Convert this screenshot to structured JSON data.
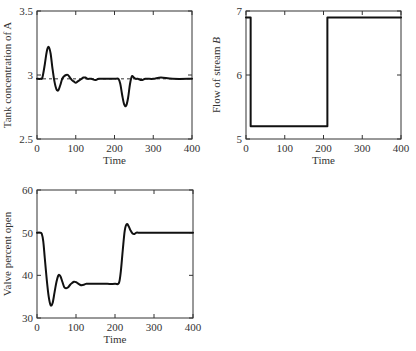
{
  "chart_data": [
    {
      "id": "tank-concentration",
      "type": "line",
      "title": "",
      "xlabel": "Time",
      "ylabel": "Tank concentration of A",
      "ylabel_italic_part": "",
      "xlim": [
        0,
        400
      ],
      "ylim": [
        2.5,
        3.5
      ],
      "xticks": [
        0,
        100,
        200,
        300,
        400
      ],
      "yticks": [
        2.5,
        3,
        3.5
      ],
      "ytick_labels": [
        "2.5",
        "3",
        "3.5"
      ],
      "grid": false,
      "legend": null,
      "frame_px": {
        "x0": 37,
        "y0": 11,
        "x1": 192,
        "y1": 139
      },
      "reference_line": {
        "y": 2.97,
        "style": "dashed",
        "from_x": 0,
        "to_x": 400
      },
      "series": [
        {
          "name": "concentration",
          "x": [
            0,
            10,
            14,
            20,
            25,
            30,
            35,
            40,
            45,
            50,
            55,
            60,
            65,
            70,
            75,
            80,
            85,
            90,
            95,
            100,
            105,
            110,
            115,
            120,
            125,
            130,
            140,
            150,
            160,
            180,
            200,
            210,
            215,
            220,
            225,
            230,
            235,
            240,
            245,
            250,
            255,
            260,
            270,
            280,
            300,
            320,
            350,
            400
          ],
          "y": [
            2.97,
            2.97,
            2.98,
            3.08,
            3.18,
            3.22,
            3.17,
            3.05,
            2.95,
            2.89,
            2.88,
            2.92,
            2.97,
            2.99,
            3.0,
            3.0,
            2.98,
            2.96,
            2.95,
            2.94,
            2.95,
            2.96,
            2.97,
            2.98,
            2.98,
            2.97,
            2.97,
            2.96,
            2.97,
            2.97,
            2.97,
            2.97,
            2.93,
            2.84,
            2.77,
            2.76,
            2.82,
            2.93,
            2.99,
            2.98,
            2.97,
            2.97,
            2.96,
            2.97,
            2.97,
            2.98,
            2.97,
            2.97
          ]
        }
      ]
    },
    {
      "id": "flow-stream-b",
      "type": "line",
      "title": "",
      "xlabel": "Time",
      "ylabel": "Flow of stream ",
      "ylabel_italic_part": "B",
      "xlim": [
        0,
        400
      ],
      "ylim": [
        5,
        7
      ],
      "xticks": [
        0,
        100,
        200,
        300,
        400
      ],
      "yticks": [
        5,
        6,
        7
      ],
      "ytick_labels": [
        "5",
        "6",
        "7"
      ],
      "grid": false,
      "legend": null,
      "frame_px": {
        "x0": 246,
        "y0": 11,
        "x1": 401,
        "y1": 139
      },
      "reference_line": null,
      "series": [
        {
          "name": "flow",
          "x": [
            0,
            12,
            12,
            210,
            210,
            400
          ],
          "y": [
            6.9,
            6.9,
            5.2,
            5.2,
            6.9,
            6.9
          ]
        }
      ]
    },
    {
      "id": "valve-percent-open",
      "type": "line",
      "title": "",
      "xlabel": "Time",
      "ylabel": "Valve percent open",
      "ylabel_italic_part": "",
      "xlim": [
        0,
        400
      ],
      "ylim": [
        30,
        60
      ],
      "xticks": [
        0,
        100,
        200,
        300,
        400
      ],
      "yticks": [
        30,
        40,
        50,
        60
      ],
      "ytick_labels": [
        "30",
        "40",
        "50",
        "60"
      ],
      "grid": false,
      "legend": null,
      "frame_px": {
        "x0": 37,
        "y0": 190,
        "x1": 193,
        "y1": 318
      },
      "reference_line": null,
      "series": [
        {
          "name": "valve",
          "x": [
            0,
            8,
            12,
            16,
            20,
            25,
            30,
            35,
            40,
            45,
            50,
            55,
            60,
            65,
            70,
            75,
            80,
            85,
            90,
            95,
            100,
            105,
            110,
            115,
            120,
            125,
            130,
            135,
            140,
            150,
            160,
            180,
            200,
            210,
            215,
            220,
            225,
            230,
            235,
            240,
            245,
            250,
            255,
            260,
            280,
            300,
            350,
            400
          ],
          "y": [
            50,
            50,
            49.8,
            48,
            44,
            39,
            35,
            33,
            33.5,
            36,
            38.5,
            40,
            39.8,
            38.5,
            37.2,
            37,
            37.2,
            37.8,
            38.2,
            38.5,
            38.4,
            38.1,
            37.8,
            37.7,
            37.8,
            38,
            38,
            38,
            38,
            38,
            38,
            38,
            38,
            38.2,
            41,
            46,
            50.5,
            52,
            51.5,
            50.5,
            49.8,
            49.7,
            50,
            50,
            50,
            50,
            50,
            50
          ]
        }
      ]
    }
  ]
}
